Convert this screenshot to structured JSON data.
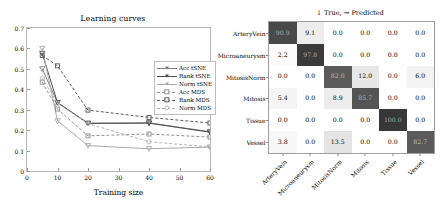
{
  "chart_data": [
    {
      "type": "line",
      "title": "Learning curves",
      "xlabel": "Training size",
      "ylabel": "Error",
      "xlim": [
        0,
        60
      ],
      "ylim": [
        0,
        0.7
      ],
      "xticks": [
        0,
        10,
        20,
        30,
        40,
        50,
        60
      ],
      "xtick_labels": [
        "0",
        "10",
        "20",
        "30",
        "40",
        "50",
        "60"
      ],
      "yticks": [
        0,
        0.1,
        0.2,
        0.3,
        0.4,
        0.5,
        0.6,
        0.7
      ],
      "ytick_labels": [
        "0",
        "0.1",
        "0.2",
        "0.3",
        "0.4",
        "0.5",
        "0.6",
        "0.7"
      ],
      "grid": false,
      "legend_position": "upper right",
      "x": [
        5,
        10,
        20,
        40,
        60
      ],
      "series": [
        {
          "name": "Acc tSNE",
          "values": [
            0.5,
            0.335,
            0.234,
            0.236,
            0.192
          ],
          "color": "#7f7f7f",
          "style": "solid",
          "marker": "triangle-down"
        },
        {
          "name": "Rank tSNE",
          "values": [
            0.575,
            0.335,
            0.233,
            0.234,
            0.19
          ],
          "color": "#4d4d4d",
          "style": "solid",
          "marker": "triangle-down"
        },
        {
          "name": "Norm tSNE",
          "values": [
            0.6,
            0.245,
            0.124,
            0.109,
            0.117
          ],
          "color": "#a8a8a8",
          "style": "solid",
          "marker": "triangle-down"
        },
        {
          "name": "Acc MDS",
          "values": [
            0.435,
            0.303,
            0.172,
            0.181,
            0.166
          ],
          "color": "#909090",
          "style": "dashed",
          "marker": "square"
        },
        {
          "name": "Rank MDS",
          "values": [
            0.565,
            0.515,
            0.298,
            0.262,
            0.235
          ],
          "color": "#5a5a5a",
          "style": "dashed",
          "marker": "square"
        },
        {
          "name": "Norm MDS",
          "values": [
            0.455,
            0.332,
            0.232,
            0.143,
            0.118
          ],
          "color": "#b5b5b5",
          "style": "dashed",
          "marker": "circle"
        }
      ]
    },
    {
      "type": "heatmap",
      "title": "↓ True, → Predicted",
      "xlabel": "",
      "ylabel": "",
      "row_labels": [
        "ArteryVein",
        "Microaneurysm",
        "MitosisNorm",
        "Mitosis",
        "Tissue",
        "Vessel"
      ],
      "col_labels": [
        "ArteryVein",
        "Microaneurysm",
        "MitosisNorm",
        "Mitosis",
        "Tissue",
        "Vessel"
      ],
      "values": [
        [
          "90.9",
          "9.1",
          "0.0",
          "0.0",
          "0.0",
          "0.0"
        ],
        [
          "2.2",
          "97.8",
          "0.0",
          "0.0",
          "0.0",
          "0.0"
        ],
        [
          "0.0",
          "0.0",
          "82.0",
          "12.0",
          "0.0",
          "6.0"
        ],
        [
          "5.4",
          "0.0",
          "8.9",
          "85.7",
          "0.0",
          "0.0"
        ],
        [
          "0.0",
          "0.0",
          "0.0",
          "0.0",
          "100.0",
          "0.0"
        ],
        [
          "3.8",
          "0.0",
          "13.5",
          "0.0",
          "0.0",
          "82.7"
        ]
      ],
      "numeric_values": [
        [
          90.9,
          9.1,
          0.0,
          0.0,
          0.0,
          0.0
        ],
        [
          2.2,
          97.8,
          0.0,
          0.0,
          0.0,
          0.0
        ],
        [
          0.0,
          0.0,
          82.0,
          12.0,
          0.0,
          6.0
        ],
        [
          5.4,
          0.0,
          8.9,
          85.7,
          0.0,
          0.0
        ],
        [
          0.0,
          0.0,
          0.0,
          0.0,
          100.0,
          0.0
        ],
        [
          3.8,
          0.0,
          13.5,
          0.0,
          0.0,
          82.7
        ]
      ],
      "colormap": "greys",
      "vmin": 0,
      "vmax": 100
    }
  ]
}
